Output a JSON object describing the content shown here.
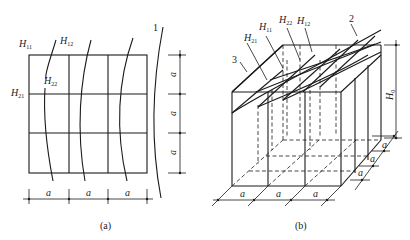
{
  "figure_a": {
    "caption": "(a)",
    "labels": {
      "H11": {
        "main": "H",
        "sub": "11"
      },
      "H12": {
        "main": "H",
        "sub": "12"
      },
      "H21": {
        "main": "H",
        "sub": "21"
      },
      "H22": {
        "main": "H",
        "sub": "22"
      },
      "callout_1": "1"
    },
    "grid": {
      "rows": 3,
      "cols": 3
    },
    "dimensions": {
      "bottom": [
        "a",
        "a",
        "a"
      ],
      "right": [
        "a",
        "a",
        "a"
      ]
    }
  },
  "figure_b": {
    "caption": "(b)",
    "labels": {
      "H11": {
        "main": "H",
        "sub": "11"
      },
      "H12": {
        "main": "H",
        "sub": "12"
      },
      "H21": {
        "main": "H",
        "sub": "21"
      },
      "H22": {
        "main": "H",
        "sub": "22"
      },
      "H0": {
        "main": "H",
        "sub": "0"
      },
      "callout_2": "2",
      "callout_3": "3"
    },
    "dimensions": {
      "bottom": [
        "a",
        "a",
        "a"
      ],
      "depth": [
        "a",
        "a",
        "a"
      ]
    }
  }
}
